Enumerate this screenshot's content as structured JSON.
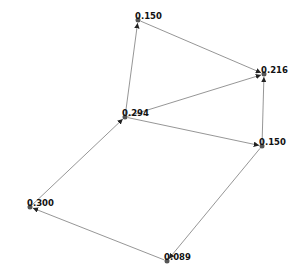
{
  "graph": {
    "type": "directed",
    "nodes": [
      {
        "id": "n_top",
        "label": "0.150",
        "x": 138,
        "y": 20
      },
      {
        "id": "n_right",
        "label": "0.216",
        "x": 264,
        "y": 74
      },
      {
        "id": "n_center",
        "label": "0.294",
        "x": 125,
        "y": 117
      },
      {
        "id": "n_lowright",
        "label": "0.150",
        "x": 262,
        "y": 146
      },
      {
        "id": "n_left",
        "label": "0.300",
        "x": 30,
        "y": 207
      },
      {
        "id": "n_bottom",
        "label": "0.089",
        "x": 167,
        "y": 261
      }
    ],
    "edges": [
      {
        "from": "n_center",
        "to": "n_top"
      },
      {
        "from": "n_top",
        "to": "n_right"
      },
      {
        "from": "n_center",
        "to": "n_right"
      },
      {
        "from": "n_lowright",
        "to": "n_right"
      },
      {
        "from": "n_center",
        "to": "n_lowright"
      },
      {
        "from": "n_lowright",
        "to": "n_bottom"
      },
      {
        "from": "n_bottom",
        "to": "n_left"
      },
      {
        "from": "n_left",
        "to": "n_center"
      }
    ]
  }
}
